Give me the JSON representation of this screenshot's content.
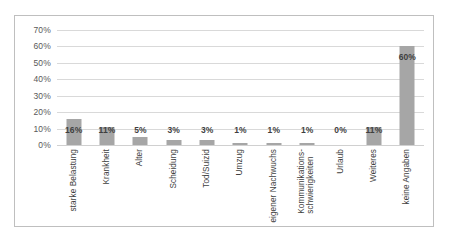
{
  "chart_data": {
    "type": "bar",
    "title": "",
    "subtitle": "",
    "xlabel": "",
    "ylabel": "",
    "ylim": [
      0,
      70
    ],
    "y_ticks": [
      "0%",
      "10%",
      "20%",
      "30%",
      "40%",
      "50%",
      "60%",
      "70%"
    ],
    "y_tick_values": [
      0,
      10,
      20,
      30,
      40,
      50,
      60,
      70
    ],
    "grid": true,
    "legend": "none",
    "bar_color": "#a6a6a6",
    "gridline_color": "#d9d9d9",
    "border_color": "#bfbfbf",
    "categories": [
      "starke Belastung",
      "Krankheit",
      "Alter",
      "Scheidung",
      "Tod/Suizid",
      "Umzug",
      "eigener Nachwuchs",
      "Kommunikations-schwierigkeiten",
      "Urlaub",
      "Weiteres",
      "keine Angaben"
    ],
    "category_lines": [
      [
        "starke Belastung"
      ],
      [
        "Krankheit"
      ],
      [
        "Alter"
      ],
      [
        "Scheidung"
      ],
      [
        "Tod/Suizid"
      ],
      [
        "Umzug"
      ],
      [
        "eigener Nachwuchs"
      ],
      [
        "Kommunikations-",
        "schwierigkeiten"
      ],
      [
        "Urlaub"
      ],
      [
        "Weiteres"
      ],
      [
        "keine Angaben"
      ]
    ],
    "values": [
      16,
      11,
      5,
      3,
      3,
      1,
      1,
      1,
      0,
      11,
      60
    ],
    "data_labels": [
      "16%",
      "11%",
      "5%",
      "3%",
      "3%",
      "1%",
      "1%",
      "1%",
      "0%",
      "11%",
      "60%"
    ]
  }
}
